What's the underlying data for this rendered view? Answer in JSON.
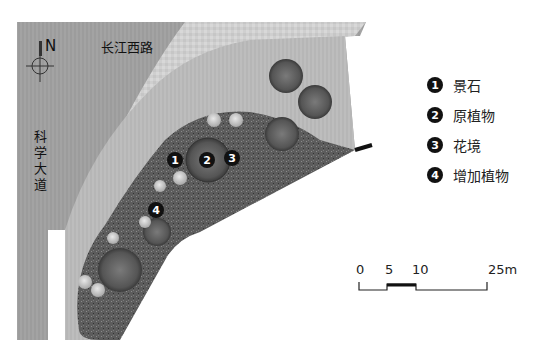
{
  "title_fragment": "· · · · · ·",
  "compass": {
    "label": "N",
    "icon": "north-arrow-icon"
  },
  "roads": {
    "top": "长江西路",
    "left": "科学大道"
  },
  "markers": [
    {
      "num": "1",
      "x": 167,
      "y": 160
    },
    {
      "num": "2",
      "x": 199,
      "y": 160
    },
    {
      "num": "3",
      "x": 224,
      "y": 158
    },
    {
      "num": "4",
      "x": 148,
      "y": 203
    }
  ],
  "legend": [
    {
      "num": "1",
      "label": "景石"
    },
    {
      "num": "2",
      "label": "原植物"
    },
    {
      "num": "3",
      "label": "花境"
    },
    {
      "num": "4",
      "label": "增加植物"
    }
  ],
  "scale_bar": {
    "ticks": [
      "0",
      "5",
      "10",
      "25m"
    ],
    "unit": "m"
  },
  "colors": {
    "road": "#9a9a9a",
    "sidewalk": "#c9c9c9",
    "lawn": "#b4b4b4",
    "planting_bed": "#5a5a5a",
    "marker": "#111111"
  }
}
